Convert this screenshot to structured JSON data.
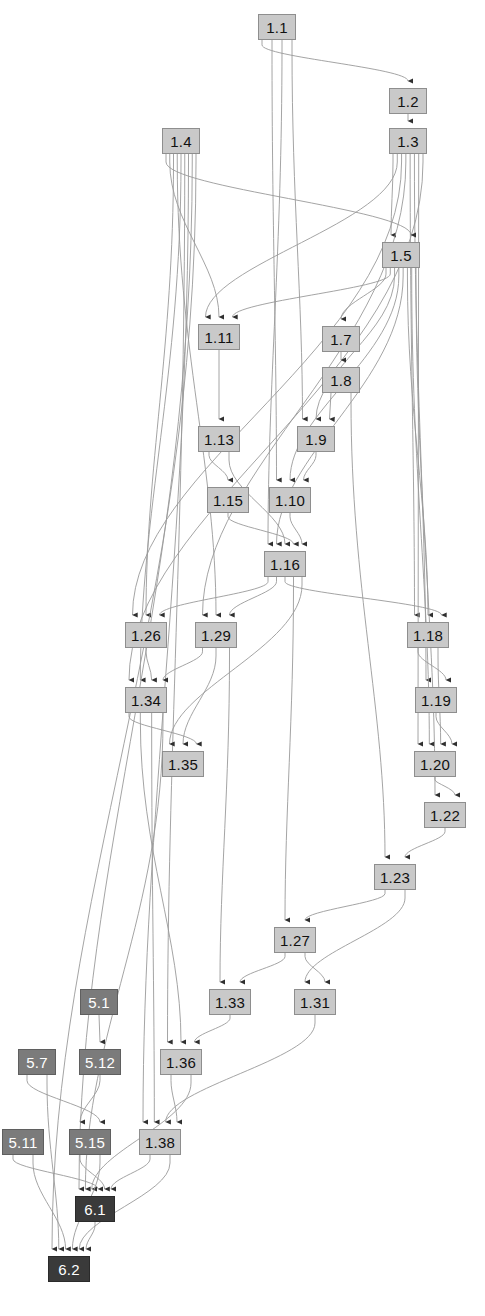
{
  "diagram": {
    "canvas": {
      "width": 485,
      "height": 1316
    },
    "colors": {
      "level1_fill": "#c9c9c9",
      "level1_text": "#111111",
      "level5_fill": "#7b7b7b",
      "level5_text": "#ffffff",
      "level6_fill": "#3a3a3a",
      "level6_text": "#ffffff",
      "edge": "#9a9a9a",
      "background": "#ffffff"
    },
    "nodes": [
      {
        "id": "1.1",
        "label": "1.1",
        "group": "lvl1",
        "x": 258,
        "y": 14,
        "w": 38,
        "h": 26
      },
      {
        "id": "1.2",
        "label": "1.2",
        "group": "lvl1",
        "x": 389,
        "y": 88,
        "w": 38,
        "h": 26
      },
      {
        "id": "1.3",
        "label": "1.3",
        "group": "lvl1",
        "x": 389,
        "y": 128,
        "w": 38,
        "h": 26
      },
      {
        "id": "1.4",
        "label": "1.4",
        "group": "lvl1",
        "x": 162,
        "y": 128,
        "w": 38,
        "h": 26
      },
      {
        "id": "1.5",
        "label": "1.5",
        "group": "lvl1",
        "x": 382,
        "y": 242,
        "w": 38,
        "h": 26
      },
      {
        "id": "1.7",
        "label": "1.7",
        "group": "lvl1",
        "x": 322,
        "y": 326,
        "w": 38,
        "h": 26
      },
      {
        "id": "1.8",
        "label": "1.8",
        "group": "lvl1",
        "x": 322,
        "y": 367,
        "w": 38,
        "h": 26
      },
      {
        "id": "1.11",
        "label": "1.11",
        "group": "lvl1",
        "x": 198,
        "y": 324,
        "w": 42,
        "h": 26
      },
      {
        "id": "1.9",
        "label": "1.9",
        "group": "lvl1",
        "x": 297,
        "y": 426,
        "w": 38,
        "h": 26
      },
      {
        "id": "1.13",
        "label": "1.13",
        "group": "lvl1",
        "x": 198,
        "y": 426,
        "w": 42,
        "h": 26
      },
      {
        "id": "1.15",
        "label": "1.15",
        "group": "lvl1",
        "x": 207,
        "y": 487,
        "w": 42,
        "h": 26
      },
      {
        "id": "1.10",
        "label": "1.10",
        "group": "lvl1",
        "x": 269,
        "y": 487,
        "w": 42,
        "h": 26
      },
      {
        "id": "1.16",
        "label": "1.16",
        "group": "lvl1",
        "x": 264,
        "y": 551,
        "w": 42,
        "h": 26
      },
      {
        "id": "1.26",
        "label": "1.26",
        "group": "lvl1",
        "x": 125,
        "y": 622,
        "w": 42,
        "h": 26
      },
      {
        "id": "1.29",
        "label": "1.29",
        "group": "lvl1",
        "x": 195,
        "y": 622,
        "w": 42,
        "h": 26
      },
      {
        "id": "1.18",
        "label": "1.18",
        "group": "lvl1",
        "x": 407,
        "y": 622,
        "w": 42,
        "h": 26
      },
      {
        "id": "1.34",
        "label": "1.34",
        "group": "lvl1",
        "x": 125,
        "y": 687,
        "w": 42,
        "h": 26
      },
      {
        "id": "1.19",
        "label": "1.19",
        "group": "lvl1",
        "x": 415,
        "y": 687,
        "w": 42,
        "h": 26
      },
      {
        "id": "1.35",
        "label": "1.35",
        "group": "lvl1",
        "x": 162,
        "y": 751,
        "w": 42,
        "h": 26
      },
      {
        "id": "1.20",
        "label": "1.20",
        "group": "lvl1",
        "x": 414,
        "y": 751,
        "w": 42,
        "h": 26
      },
      {
        "id": "1.22",
        "label": "1.22",
        "group": "lvl1",
        "x": 424,
        "y": 802,
        "w": 42,
        "h": 26
      },
      {
        "id": "1.23",
        "label": "1.23",
        "group": "lvl1",
        "x": 374,
        "y": 864,
        "w": 42,
        "h": 26
      },
      {
        "id": "1.27",
        "label": "1.27",
        "group": "lvl1",
        "x": 274,
        "y": 927,
        "w": 42,
        "h": 26
      },
      {
        "id": "1.33",
        "label": "1.33",
        "group": "lvl1",
        "x": 209,
        "y": 989,
        "w": 42,
        "h": 26
      },
      {
        "id": "1.31",
        "label": "1.31",
        "group": "lvl1",
        "x": 294,
        "y": 989,
        "w": 42,
        "h": 26
      },
      {
        "id": "5.1",
        "label": "5.1",
        "group": "lvl5",
        "x": 80,
        "y": 989,
        "w": 38,
        "h": 26
      },
      {
        "id": "1.36",
        "label": "1.36",
        "group": "lvl1",
        "x": 160,
        "y": 1049,
        "w": 42,
        "h": 26
      },
      {
        "id": "5.12",
        "label": "5.12",
        "group": "lvl5",
        "x": 79,
        "y": 1049,
        "w": 42,
        "h": 26
      },
      {
        "id": "5.7",
        "label": "5.7",
        "group": "lvl5",
        "x": 18,
        "y": 1049,
        "w": 38,
        "h": 26
      },
      {
        "id": "5.11",
        "label": "5.11",
        "group": "lvl5",
        "x": 2,
        "y": 1129,
        "w": 42,
        "h": 26
      },
      {
        "id": "5.15",
        "label": "5.15",
        "group": "lvl5",
        "x": 69,
        "y": 1129,
        "w": 42,
        "h": 26
      },
      {
        "id": "1.38",
        "label": "1.38",
        "group": "lvl1",
        "x": 139,
        "y": 1129,
        "w": 42,
        "h": 26
      },
      {
        "id": "6.1",
        "label": "6.1",
        "group": "lvl6",
        "x": 75,
        "y": 1196,
        "w": 40,
        "h": 26
      },
      {
        "id": "6.2",
        "label": "6.2",
        "group": "lvl6",
        "x": 48,
        "y": 1256,
        "w": 42,
        "h": 26
      }
    ],
    "edges": [
      {
        "from": "1.1",
        "to": "1.2"
      },
      {
        "from": "1.1",
        "to": "1.10"
      },
      {
        "from": "1.1",
        "to": "1.16"
      },
      {
        "from": "1.1",
        "to": "1.9"
      },
      {
        "from": "1.2",
        "to": "1.3"
      },
      {
        "from": "1.3",
        "to": "1.5"
      },
      {
        "from": "1.3",
        "to": "1.11"
      },
      {
        "from": "1.3",
        "to": "1.26"
      },
      {
        "from": "1.3",
        "to": "1.29"
      },
      {
        "from": "1.3",
        "to": "1.18"
      },
      {
        "from": "1.3",
        "to": "1.19"
      },
      {
        "from": "1.3",
        "to": "1.20"
      },
      {
        "from": "1.3",
        "to": "1.34"
      },
      {
        "from": "1.4",
        "to": "1.5"
      },
      {
        "from": "1.4",
        "to": "1.11"
      },
      {
        "from": "1.4",
        "to": "1.26"
      },
      {
        "from": "1.4",
        "to": "1.29"
      },
      {
        "from": "1.4",
        "to": "1.34"
      },
      {
        "from": "1.4",
        "to": "1.36"
      },
      {
        "from": "1.4",
        "to": "1.38"
      },
      {
        "from": "1.4",
        "to": "6.1"
      },
      {
        "from": "1.4",
        "to": "6.2"
      },
      {
        "from": "1.5",
        "to": "1.7"
      },
      {
        "from": "1.5",
        "to": "1.11"
      },
      {
        "from": "1.5",
        "to": "1.9"
      },
      {
        "from": "1.5",
        "to": "1.10"
      },
      {
        "from": "1.5",
        "to": "1.16"
      },
      {
        "from": "1.5",
        "to": "1.18"
      },
      {
        "from": "1.5",
        "to": "1.20"
      },
      {
        "from": "1.5",
        "to": "1.22"
      },
      {
        "from": "1.7",
        "to": "1.8"
      },
      {
        "from": "1.8",
        "to": "1.9"
      },
      {
        "from": "1.8",
        "to": "1.23"
      },
      {
        "from": "1.11",
        "to": "1.13"
      },
      {
        "from": "1.13",
        "to": "1.15"
      },
      {
        "from": "1.13",
        "to": "1.16"
      },
      {
        "from": "1.9",
        "to": "1.10"
      },
      {
        "from": "1.15",
        "to": "1.16"
      },
      {
        "from": "1.10",
        "to": "1.16"
      },
      {
        "from": "1.16",
        "to": "1.26"
      },
      {
        "from": "1.16",
        "to": "1.29"
      },
      {
        "from": "1.16",
        "to": "1.18"
      },
      {
        "from": "1.16",
        "to": "1.27"
      },
      {
        "from": "1.16",
        "to": "1.35"
      },
      {
        "from": "1.26",
        "to": "1.34"
      },
      {
        "from": "1.29",
        "to": "1.34"
      },
      {
        "from": "1.29",
        "to": "1.35"
      },
      {
        "from": "1.29",
        "to": "1.33"
      },
      {
        "from": "1.34",
        "to": "1.35"
      },
      {
        "from": "1.34",
        "to": "1.36"
      },
      {
        "from": "1.34",
        "to": "1.38"
      },
      {
        "from": "1.34",
        "to": "6.1"
      },
      {
        "from": "1.18",
        "to": "1.19"
      },
      {
        "from": "1.18",
        "to": "1.20"
      },
      {
        "from": "1.19",
        "to": "1.20"
      },
      {
        "from": "1.20",
        "to": "1.22"
      },
      {
        "from": "1.22",
        "to": "1.23"
      },
      {
        "from": "1.23",
        "to": "1.27"
      },
      {
        "from": "1.23",
        "to": "1.31"
      },
      {
        "from": "1.27",
        "to": "1.33"
      },
      {
        "from": "1.27",
        "to": "1.31"
      },
      {
        "from": "1.33",
        "to": "1.36"
      },
      {
        "from": "1.31",
        "to": "1.38"
      },
      {
        "from": "1.36",
        "to": "1.38"
      },
      {
        "from": "1.36",
        "to": "6.1"
      },
      {
        "from": "5.1",
        "to": "5.12"
      },
      {
        "from": "5.12",
        "to": "5.15"
      },
      {
        "from": "5.7",
        "to": "5.15"
      },
      {
        "from": "5.7",
        "to": "6.2"
      },
      {
        "from": "5.11",
        "to": "6.1"
      },
      {
        "from": "5.11",
        "to": "6.2"
      },
      {
        "from": "5.15",
        "to": "6.1"
      },
      {
        "from": "5.15",
        "to": "6.2"
      },
      {
        "from": "1.38",
        "to": "6.1"
      },
      {
        "from": "1.38",
        "to": "6.2"
      },
      {
        "from": "6.1",
        "to": "6.2"
      }
    ]
  }
}
